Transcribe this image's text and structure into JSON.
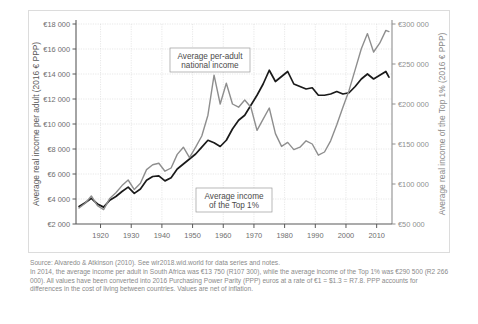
{
  "figure": {
    "source_note": "Source: Alvaredo & Atkinson (2010). See wir2018.wid.world for data series and notes.",
    "explanatory_note": "In 2014, the average income per adult in South Africa was €13 750 (R107 300), while the average income of the Top 1% was €290 500 (R2 266 000). All values have been converted into 2016 Purchasing Power Parity (PPP) euros at a rate of €1 = $1.3 = R7.8. PPP accounts for differences in the cost of living between countries. Values are net of inflation."
  },
  "annotations": {
    "series_black_label_line1": "Average per-adult",
    "series_black_label_line2": "national income",
    "series_grey_label_line1": "Average income",
    "series_grey_label_line2": "of the Top 1%"
  },
  "colors": {
    "series_black": "#1a1a1a",
    "series_grey": "#8e8e8e",
    "grid": "#d9d9d9",
    "axis_left": "#595959",
    "axis_right": "#8f8f8f",
    "note_text": "#8a8a8a"
  },
  "chart_data": {
    "type": "line",
    "title": "",
    "subtitle": "",
    "xlabel": "",
    "ylabel": "Average real income per adult (2016 € PPP)",
    "ylabel_right": "Average real income of the Top 1% (2016 € PPP)",
    "grid": true,
    "legend": "annotations-inline",
    "xlim": [
      1912,
      2015
    ],
    "xticks": [
      1920,
      1930,
      1940,
      1950,
      1960,
      1970,
      1980,
      1990,
      2000,
      2010
    ],
    "xticklabels": [
      "1920",
      "1930",
      "1940",
      "1950",
      "1960",
      "1970",
      "1980",
      "1990",
      "2000",
      "2010"
    ],
    "ylim": [
      2000,
      18000
    ],
    "yticks": [
      2000,
      4000,
      6000,
      8000,
      10000,
      12000,
      14000,
      16000,
      18000
    ],
    "yticklabels": [
      "€2 000",
      "€4 000",
      "€6 000",
      "€8 000",
      "€10 000",
      "€12 000",
      "€14 000",
      "€16 000",
      "€18 000"
    ],
    "ylim_right": [
      50000,
      300000
    ],
    "yticks_right": [
      50000,
      100000,
      150000,
      200000,
      250000,
      300000
    ],
    "yticklabels_right": [
      "€50 000",
      "€100 000",
      "€150 000",
      "€200 000",
      "€250 000",
      "€300 000"
    ],
    "series": [
      {
        "name": "Average per-adult national income",
        "axis": "left",
        "color": "#1a1a1a",
        "x": [
          1913,
          1915,
          1917,
          1919,
          1921,
          1923,
          1925,
          1927,
          1929,
          1931,
          1933,
          1935,
          1937,
          1939,
          1941,
          1943,
          1945,
          1947,
          1949,
          1951,
          1953,
          1955,
          1957,
          1959,
          1961,
          1963,
          1965,
          1967,
          1969,
          1971,
          1973,
          1975,
          1977,
          1979,
          1981,
          1983,
          1985,
          1987,
          1989,
          1991,
          1993,
          1995,
          1997,
          1999,
          2001,
          2003,
          2005,
          2007,
          2009,
          2011,
          2013,
          2014
        ],
        "y": [
          3400,
          3700,
          4050,
          3600,
          3350,
          3900,
          4200,
          4600,
          4950,
          4450,
          4800,
          5500,
          5800,
          5850,
          5450,
          5700,
          6400,
          6800,
          7200,
          7600,
          8150,
          8700,
          8500,
          8200,
          8700,
          9600,
          10300,
          10700,
          11500,
          12300,
          13200,
          14300,
          13400,
          13800,
          14200,
          13200,
          13000,
          12800,
          12900,
          12300,
          12300,
          12400,
          12600,
          12400,
          12500,
          13000,
          13600,
          14000,
          13600,
          13900,
          14200,
          13750
        ]
      },
      {
        "name": "Average income of the Top 1%",
        "axis": "right",
        "color": "#8e8e8e",
        "x": [
          1913,
          1915,
          1917,
          1919,
          1921,
          1923,
          1925,
          1927,
          1929,
          1931,
          1933,
          1935,
          1937,
          1939,
          1941,
          1943,
          1945,
          1947,
          1949,
          1951,
          1953,
          1955,
          1957,
          1959,
          1961,
          1963,
          1965,
          1967,
          1969,
          1971,
          1973,
          1975,
          1977,
          1979,
          1981,
          1983,
          1985,
          1987,
          1989,
          1991,
          1993,
          1995,
          1997,
          1999,
          2001,
          2003,
          2005,
          2007,
          2009,
          2011,
          2013,
          2014
        ],
        "y": [
          70000,
          76000,
          85000,
          73000,
          68000,
          82000,
          89000,
          98000,
          105000,
          93000,
          101000,
          118000,
          124000,
          126000,
          116000,
          120000,
          137000,
          146000,
          133000,
          146000,
          160000,
          186000,
          236000,
          200000,
          226000,
          200000,
          196000,
          205000,
          196000,
          167000,
          181000,
          195000,
          163000,
          147000,
          152000,
          143000,
          146000,
          154000,
          150000,
          136000,
          140000,
          154000,
          174000,
          196000,
          217000,
          243000,
          269000,
          288000,
          265000,
          276000,
          292000,
          290500
        ]
      }
    ],
    "annotations": [
      {
        "text": "Average per-adult national income",
        "series": "Average per-adult national income"
      },
      {
        "text": "Average income of the Top 1%",
        "series": "Average income of the Top 1%"
      }
    ]
  }
}
